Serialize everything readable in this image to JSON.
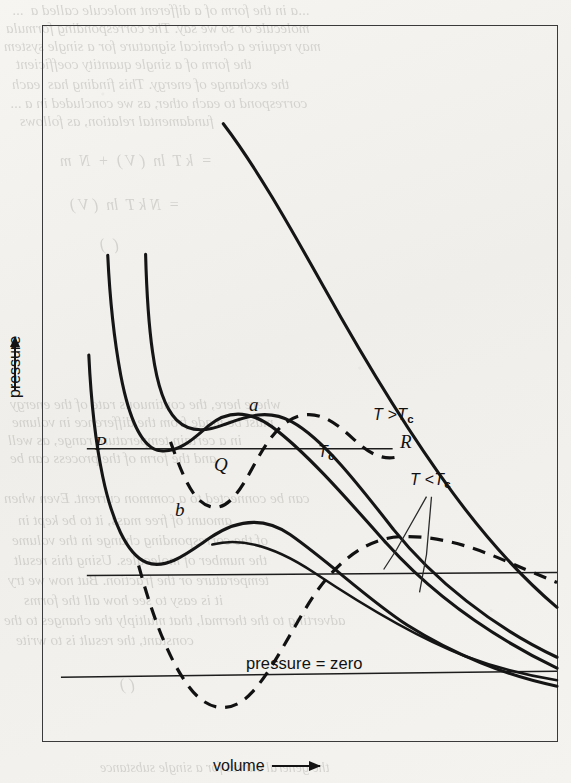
{
  "figure": {
    "axes": {
      "y_label": "pressure",
      "y_arrow": "up-arrow",
      "x_label": "volume",
      "x_arrow": "right-arrow"
    },
    "annotations": {
      "p": "P",
      "q": "Q",
      "r": "R",
      "a": "a",
      "b": "b",
      "t_above": "T >T",
      "t_above_sub": "c",
      "t_critical": "T",
      "t_critical_sub": "c",
      "t_below": "T <T",
      "t_below_sub": "c",
      "pressure_zero": "pressure = zero"
    }
  },
  "chart_data": {
    "type": "line",
    "title": "",
    "xlabel": "volume",
    "ylabel": "pressure",
    "xlim": [
      0,
      100
    ],
    "ylim": [
      0,
      100
    ],
    "grid": false,
    "legend": "inline-annotations",
    "axis_ticks": [],
    "series": [
      {
        "name": "T > Tc",
        "style": "solid",
        "label": "T >Tc",
        "label_at": [
          68,
          53
        ],
        "points": [
          [
            8,
            98
          ],
          [
            12,
            88
          ],
          [
            17,
            78
          ],
          [
            23,
            69
          ],
          [
            30,
            61
          ],
          [
            38,
            54
          ],
          [
            47,
            47
          ],
          [
            57,
            41
          ],
          [
            68,
            35
          ],
          [
            79,
            29
          ],
          [
            90,
            25
          ],
          [
            100,
            22
          ]
        ]
      },
      {
        "name": "Tc (critical isotherm)",
        "style": "solid",
        "label": "Tc",
        "label_at": [
          55,
          40
        ],
        "points": [
          [
            5,
            99
          ],
          [
            8,
            88
          ],
          [
            11,
            77
          ],
          [
            14,
            67
          ],
          [
            17,
            59
          ],
          [
            20,
            55
          ],
          [
            24,
            53
          ],
          [
            28,
            52
          ],
          [
            33,
            49
          ],
          [
            40,
            44
          ],
          [
            48,
            39
          ],
          [
            58,
            33
          ],
          [
            70,
            28
          ],
          [
            82,
            24
          ],
          [
            94,
            21
          ],
          [
            100,
            20
          ]
        ]
      },
      {
        "name": "T < Tc (upper subcritical)",
        "style": "solid",
        "label": "T <Tc",
        "label_at": [
          80,
          35
        ],
        "points": [
          [
            3,
            99
          ],
          [
            6,
            86
          ],
          [
            9,
            72
          ],
          [
            12,
            59
          ],
          [
            15,
            48
          ],
          [
            18,
            40
          ],
          [
            21,
            36
          ],
          [
            25,
            34
          ],
          [
            30,
            32
          ],
          [
            38,
            29
          ],
          [
            48,
            26
          ],
          [
            60,
            23
          ],
          [
            74,
            20
          ],
          [
            88,
            18
          ],
          [
            100,
            16
          ]
        ]
      },
      {
        "name": "T < Tc (lower subcritical)",
        "style": "solid",
        "label": "",
        "label_at": [
          0,
          0
        ],
        "points": [
          [
            2,
            85
          ],
          [
            4,
            70
          ],
          [
            7,
            54
          ],
          [
            10,
            41
          ],
          [
            13,
            31
          ],
          [
            16,
            25
          ],
          [
            19,
            22
          ],
          [
            24,
            20
          ],
          [
            31,
            19
          ],
          [
            41,
            18
          ],
          [
            53,
            16
          ],
          [
            67,
            14
          ],
          [
            82,
            12
          ],
          [
            100,
            11
          ]
        ]
      },
      {
        "name": "vdW loop upper (a, b, through P Q R)",
        "style": "dashed",
        "label": "",
        "label_at": [
          0,
          0
        ],
        "points": [
          [
            13,
            47
          ],
          [
            15,
            42
          ],
          [
            17,
            38
          ],
          [
            19,
            36
          ],
          [
            22,
            35
          ],
          [
            25,
            36
          ],
          [
            28,
            39
          ],
          [
            32,
            43
          ],
          [
            36,
            47
          ],
          [
            40,
            49
          ],
          [
            44,
            49
          ],
          [
            48,
            47
          ],
          [
            52,
            44
          ],
          [
            56,
            41
          ],
          [
            60,
            38
          ],
          [
            64,
            35
          ],
          [
            68,
            33
          ]
        ]
      },
      {
        "name": "vdW loop lower",
        "style": "dashed",
        "label": "",
        "label_at": [
          0,
          0
        ],
        "points": [
          [
            13,
            28
          ],
          [
            16,
            20
          ],
          [
            19,
            13
          ],
          [
            22,
            9
          ],
          [
            26,
            7
          ],
          [
            30,
            8
          ],
          [
            34,
            13
          ],
          [
            38,
            20
          ],
          [
            43,
            26
          ],
          [
            49,
            30
          ],
          [
            56,
            32
          ],
          [
            64,
            32
          ],
          [
            74,
            31
          ],
          [
            86,
            30
          ],
          [
            100,
            29
          ]
        ]
      }
    ],
    "horizontal_lines": [
      {
        "name": "tie-line-P-Q-R",
        "y": 47,
        "x_from": 8,
        "x_to": 66
      },
      {
        "name": "tie-line-lower",
        "y": 28,
        "x_from": 8,
        "x_to": 100
      },
      {
        "name": "pressure-zero-line",
        "y": 10,
        "x_from": 3,
        "x_to": 100
      }
    ],
    "marked_points": [
      {
        "label": "P",
        "x": 13,
        "y": 47
      },
      {
        "label": "Q",
        "x": 38,
        "y": 47
      },
      {
        "label": "R",
        "x": 64,
        "y": 47
      },
      {
        "label": "a",
        "x": 44,
        "y": 53
      },
      {
        "label": "b",
        "x": 24,
        "y": 31
      }
    ]
  },
  "bleed_text": {
    "lines": [
      {
        "t": "...a in the form of a different molecule called a  ...",
        "x": 12,
        "y": 2,
        "s": 15
      },
      {
        "t": "molecule or so we say. The corresponding formula",
        "x": 6,
        "y": 20,
        "s": 15
      },
      {
        "t": "may require a chemical signature for a single system",
        "x": 4,
        "y": 38,
        "s": 15
      },
      {
        "t": "the form of a single quantity coefficient",
        "x": 16,
        "y": 56,
        "s": 15
      },
      {
        "t": "the exchange of energy. This finding has  each",
        "x": 12,
        "y": 76,
        "s": 15
      },
      {
        "t": "correspond to each other, as we concluded in a ...",
        "x": 10,
        "y": 95,
        "s": 15
      },
      {
        "t": "fundamental relation, as follows",
        "x": 20,
        "y": 113,
        "s": 15
      },
      {
        "t": "=  k T  ln  ( V )  +  N  m",
        "x": 60,
        "y": 152,
        "s": 16
      },
      {
        "t": "=  N k T  ln  ( V )",
        "x": 70,
        "y": 196,
        "s": 16
      },
      {
        "t": "(  )",
        "x": 100,
        "y": 236,
        "s": 16
      },
      {
        "t": "where here, the continuous rate of the energy",
        "x": 10,
        "y": 396,
        "s": 15
      },
      {
        "t": "must be made from the difference in volume",
        "x": 12,
        "y": 414,
        "s": 15
      },
      {
        "t": "in a certain temperature range, as well",
        "x": 8,
        "y": 432,
        "s": 15
      },
      {
        "t": "and the form of the process can be",
        "x": 10,
        "y": 450,
        "s": 15
      },
      {
        "t": "can be connected to a common current. Even when",
        "x": 4,
        "y": 490,
        "s": 15
      },
      {
        "t": "amount of free mass, it to be kept in",
        "x": 18,
        "y": 512,
        "s": 15
      },
      {
        "t": "of the corresponding change in the volume",
        "x": 12,
        "y": 532,
        "s": 15
      },
      {
        "t": "the number of molecules. Using this result",
        "x": 14,
        "y": 552,
        "s": 15
      },
      {
        "t": "temperature or the fraction. But now we try",
        "x": 8,
        "y": 572,
        "s": 15
      },
      {
        "t": "it is easy to see how all the forms",
        "x": 24,
        "y": 592,
        "s": 15
      },
      {
        "t": "adverting to the thermal, that multiply the changes to the",
        "x": 4,
        "y": 612,
        "s": 15
      },
      {
        "t": "constant, the result is to write",
        "x": 16,
        "y": 632,
        "s": 15
      },
      {
        "t": "( )",
        "x": 120,
        "y": 676,
        "s": 16
      },
      {
        "t": "the general curves for a single substance",
        "x": 100,
        "y": 760,
        "s": 14
      }
    ]
  }
}
